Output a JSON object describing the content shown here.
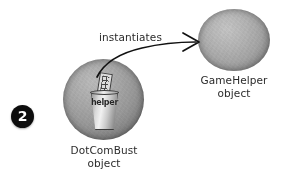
{
  "diagram": {
    "background_color": "#ffffff",
    "step": {
      "number": "2",
      "badge_color": "#0d0d0d",
      "text_color": "#ffffff"
    },
    "nodes": [
      {
        "id": "dotcombust",
        "label_line1": "DotComBust",
        "label_line2": "object",
        "shape": "sphere",
        "fill_color": "#9a9a9a",
        "edge_color": "#4f4f4f",
        "contains_icon": "helper-cup-icon",
        "icon_label": "helper"
      },
      {
        "id": "gamehelper",
        "label_line1": "GameHelper",
        "label_line2": "object",
        "shape": "sphere",
        "fill_color": "#a6a6a6",
        "edge_color": "#5c5c5c",
        "contains_icon": null,
        "icon_label": null
      }
    ],
    "edges": [
      {
        "id": "instantiates",
        "label": "instantiates",
        "from": "dotcombust",
        "to": "gamehelper",
        "style": "curved-arrow",
        "color": "#111111"
      }
    ],
    "label_text_color": "#2b2b2b"
  }
}
